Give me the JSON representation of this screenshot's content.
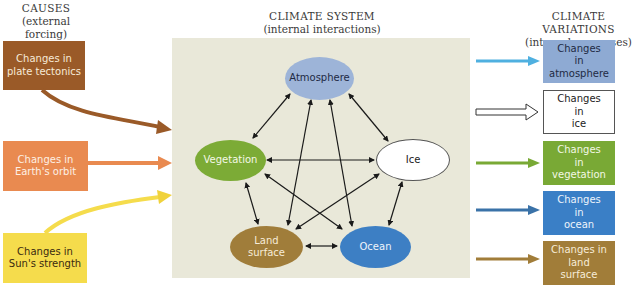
{
  "headings": {
    "causes": {
      "title": "CAUSES",
      "subtitle": "(external forcing)"
    },
    "system": {
      "title": "CLIMATE SYSTEM",
      "subtitle": "(internal interactions)"
    },
    "variations": {
      "title": "CLIMATE VARIATIONS",
      "subtitle": "(internal responses)"
    }
  },
  "causes": [
    {
      "line1": "Changes in",
      "line2": "plate tectonics",
      "color": "#9a5a28"
    },
    {
      "line1": "Changes in",
      "line2": "Earth's orbit",
      "color": "#e98a50"
    },
    {
      "line1": "Changes in",
      "line2": "Sun's strength",
      "color": "#f5dc4c"
    }
  ],
  "system_nodes": {
    "atmosphere": {
      "label": "Atmosphere",
      "color": "#9db4d8"
    },
    "vegetation": {
      "label": "Vegetation",
      "color": "#7cab36"
    },
    "ice": {
      "label": "Ice",
      "color": "#ffffff"
    },
    "land": {
      "line1": "Land",
      "line2": "surface",
      "color": "#a07d3a"
    },
    "ocean": {
      "label": "Ocean",
      "color": "#3d7fc4"
    }
  },
  "responses": [
    {
      "line1": "Changes",
      "line2": "in",
      "line3": "atmosphere",
      "color": "#8eaad3"
    },
    {
      "line1": "Changes",
      "line2": "in",
      "line3": "ice",
      "color": "#ffffff"
    },
    {
      "line1": "Changes",
      "line2": "in",
      "line3": "vegetation",
      "color": "#79a935"
    },
    {
      "line1": "Changes",
      "line2": "in",
      "line3": "ocean",
      "color": "#3a7fc6"
    },
    {
      "line1": "Changes in",
      "line2": "land",
      "line3": "surface",
      "color": "#a17d39"
    }
  ],
  "response_arrow_colors": [
    "#4fb0e0",
    "#ffffff",
    "#79a935",
    "#3a72a8",
    "#a17d39"
  ]
}
